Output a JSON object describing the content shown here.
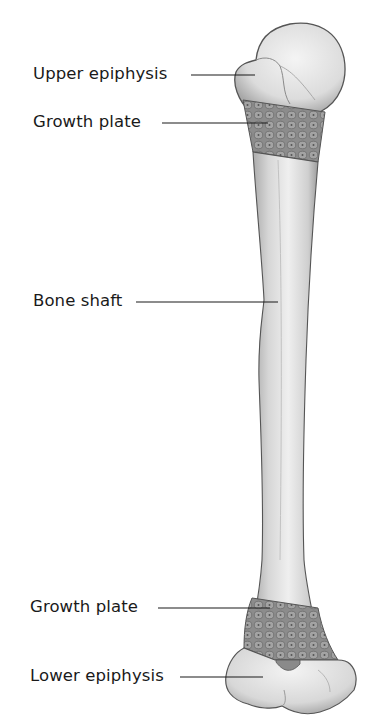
{
  "diagram": {
    "labels": [
      {
        "id": "upper-epiphysis",
        "text": "Upper epiphysis"
      },
      {
        "id": "growth-plate-upper",
        "text": "Growth plate"
      },
      {
        "id": "bone-shaft",
        "text": "Bone shaft"
      },
      {
        "id": "growth-plate-lower",
        "text": "Growth plate"
      },
      {
        "id": "lower-epiphysis",
        "text": "Lower epiphysis"
      }
    ],
    "colors": {
      "bone_fill": "#e8e8e8",
      "bone_shade": "#b5b5b5",
      "bone_outline": "#555555",
      "growth_plate": "#8a8a8a",
      "leader_line": "#1a1a1a",
      "background": "#ffffff"
    }
  }
}
